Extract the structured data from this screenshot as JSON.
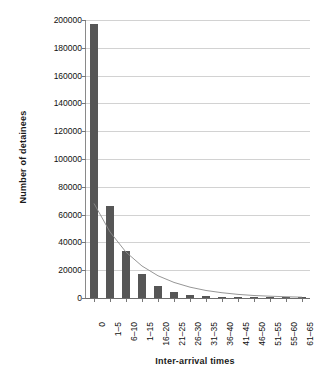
{
  "chart_data": {
    "type": "bar",
    "title": "",
    "xlabel": "Inter-arrival times",
    "ylabel": "Number of detainees",
    "categories": [
      "0",
      "1–5",
      "6–10",
      "1–15",
      "16–20",
      "21–25",
      "26–30",
      "31–35",
      "36–40",
      "41–45",
      "46–50",
      "51–55",
      "55–60",
      "61–65"
    ],
    "values": [
      197000,
      66000,
      33500,
      17500,
      8800,
      4300,
      2400,
      1400,
      900,
      600,
      400,
      300,
      200,
      150
    ],
    "ylim": [
      0,
      200000
    ],
    "yticks": [
      0,
      20000,
      40000,
      60000,
      80000,
      100000,
      120000,
      140000,
      160000,
      180000,
      200000
    ],
    "ytick_labels": [
      "0",
      "20000",
      "40000",
      "60000",
      "80000",
      "100000",
      "120000",
      "140000",
      "160000",
      "180000",
      "200000"
    ],
    "grid": true,
    "legend": "none",
    "series": [
      {
        "name": "Number of detainees",
        "type": "bar",
        "color": "#565656",
        "values": [
          197000,
          66000,
          33500,
          17500,
          8800,
          4300,
          2400,
          1400,
          900,
          600,
          400,
          300,
          200,
          150
        ]
      },
      {
        "name": "Fitted exponential curve",
        "type": "line",
        "color": "#8a8a8a",
        "values": [
          68000,
          47500,
          33000,
          23000,
          16000,
          11200,
          7800,
          5400,
          3800,
          2600,
          1800,
          1300,
          900,
          600
        ]
      }
    ]
  },
  "colors": {
    "bar": "#565656",
    "curve": "#8a8a8a",
    "grid": "#d2d2d2",
    "axis": "#6d6d6d",
    "text": "#111111",
    "background": "#ffffff"
  }
}
